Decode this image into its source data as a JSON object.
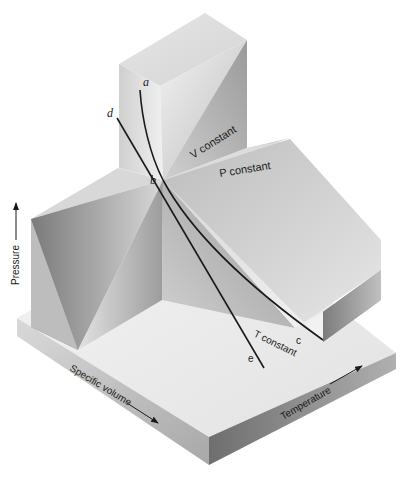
{
  "figure": {
    "axes": {
      "pressure": "Pressure",
      "specific_volume": "Specific volume",
      "temperature": "Temperature"
    },
    "section_labels": {
      "v_constant": "V constant",
      "p_constant": "P constant",
      "t_constant": "T constant"
    },
    "points": {
      "a": "a",
      "b": "b",
      "c": "c",
      "d": "d",
      "e": "e"
    },
    "colors": {
      "background": "#ffffff",
      "light_face": "#ececec",
      "mid_face": "#c8c8c8",
      "dark_face": "#8c8c8c",
      "line": "#1a1a1a"
    }
  }
}
